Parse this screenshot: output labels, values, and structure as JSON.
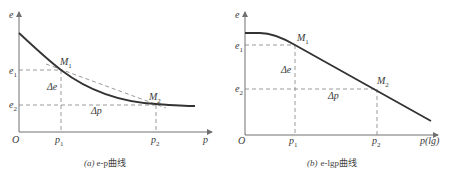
{
  "figures": [
    {
      "id": "a",
      "caption_prefix": "(a)",
      "caption_text": "e-p曲线",
      "y_axis_label": "e",
      "x_axis_label": "p",
      "origin_label": "O",
      "y_ticks": [
        {
          "main": "e",
          "sub": "1"
        },
        {
          "main": "e",
          "sub": "2"
        }
      ],
      "x_ticks": [
        {
          "main": "p",
          "sub": "1"
        },
        {
          "main": "p",
          "sub": "2"
        }
      ],
      "points": [
        {
          "main": "M",
          "sub": "1"
        },
        {
          "main": "M",
          "sub": "2"
        }
      ],
      "delta_e": "Δe",
      "delta_p": "Δp"
    },
    {
      "id": "b",
      "caption_prefix": "(b)",
      "caption_text": "e-lgp曲线",
      "y_axis_label": "e",
      "x_axis_label": "p(lg)",
      "origin_label": "O",
      "y_ticks": [
        {
          "main": "e",
          "sub": "1"
        },
        {
          "main": "e",
          "sub": "2"
        }
      ],
      "x_ticks": [
        {
          "main": "p",
          "sub": "1"
        },
        {
          "main": "p",
          "sub": "2"
        }
      ],
      "points": [
        {
          "main": "M",
          "sub": "1"
        },
        {
          "main": "M",
          "sub": "2"
        }
      ],
      "delta_e": "Δe",
      "delta_p": "Δp"
    }
  ],
  "colors": {
    "curve": "#333333",
    "axis": "#707070",
    "dash": "#808080",
    "text": "#3a3a3a"
  }
}
